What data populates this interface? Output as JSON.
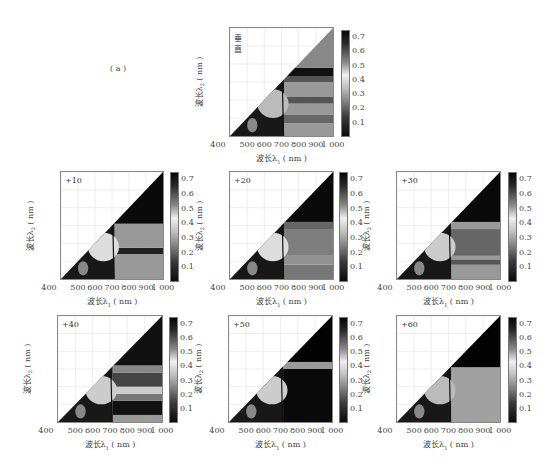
{
  "figure": {
    "label": "( a )",
    "background": "#ffffff"
  },
  "axes": {
    "xlabel": "波长λ1 ( nm )",
    "ylabel": "波长λ2 ( nm )",
    "xticks": [
      "400",
      "500",
      "600",
      "700",
      "800",
      "900",
      "1 000"
    ],
    "yticks": [
      "1 000",
      "900",
      "800",
      "700",
      "600",
      "500",
      "400"
    ],
    "colorbar_ticks": [
      "0.7",
      "0.6",
      "0.5",
      "0.4",
      "0.3",
      "0.2",
      "0.1"
    ]
  },
  "chart_data": [
    {
      "type": "heatmap",
      "title": "垂直",
      "xlabel": "波长λ1 ( nm )",
      "ylabel": "波长λ2 ( nm )",
      "xlim": [
        400,
        1000
      ],
      "ylim": [
        400,
        1000
      ],
      "xticks": [
        400,
        500,
        600,
        700,
        800,
        900,
        1000
      ],
      "yticks": [
        500,
        600,
        700,
        800,
        900,
        1000
      ],
      "colorbar": {
        "range": [
          0,
          0.75
        ],
        "ticks": [
          0.1,
          0.2,
          0.3,
          0.4,
          0.5,
          0.6,
          0.7
        ],
        "colormap": "gray_reversed"
      },
      "grid": true,
      "note": "lower-right triangle (λ1 > λ2) filled; upper-left blank",
      "bands": [
        {
          "y_from": 400,
          "y_to": 470,
          "value": 0.3
        },
        {
          "y_from": 470,
          "y_to": 520,
          "value": 0.45
        },
        {
          "y_from": 520,
          "y_to": 580,
          "value": 0.3
        },
        {
          "y_from": 580,
          "y_to": 620,
          "value": 0.5
        },
        {
          "y_from": 620,
          "y_to": 700,
          "value": 0.3
        },
        {
          "y_from": 700,
          "y_to": 730,
          "value": 0.5
        },
        {
          "y_from": 730,
          "y_to": 780,
          "value": 0.7
        },
        {
          "y_from": 780,
          "y_to": 1000,
          "value": 0.35
        }
      ],
      "left_region_value": 0.55
    },
    {
      "type": "heatmap",
      "title": "+10",
      "xlabel": "波长λ1 ( nm )",
      "ylabel": "波长λ2 ( nm )",
      "xlim": [
        400,
        1000
      ],
      "ylim": [
        400,
        1000
      ],
      "xticks": [
        400,
        500,
        600,
        700,
        800,
        900,
        1000
      ],
      "yticks": [
        500,
        600,
        700,
        800,
        900,
        1000
      ],
      "colorbar": {
        "range": [
          0,
          0.75
        ],
        "ticks": [
          0.1,
          0.2,
          0.3,
          0.4,
          0.5,
          0.6,
          0.7
        ],
        "colormap": "gray_reversed"
      },
      "grid": true,
      "bands": [
        {
          "y_from": 400,
          "y_to": 540,
          "value": 0.3
        },
        {
          "y_from": 540,
          "y_to": 575,
          "value": 0.65
        },
        {
          "y_from": 575,
          "y_to": 710,
          "value": 0.3
        },
        {
          "y_from": 710,
          "y_to": 1000,
          "value": 0.72
        }
      ],
      "left_region_value": 0.65
    },
    {
      "type": "heatmap",
      "title": "+20",
      "xlabel": "波长λ1 ( nm )",
      "ylabel": "波长λ2 ( nm )",
      "xlim": [
        400,
        1000
      ],
      "ylim": [
        400,
        1000
      ],
      "xticks": [
        400,
        500,
        600,
        700,
        800,
        900,
        1000
      ],
      "yticks": [
        500,
        600,
        700,
        800,
        900,
        1000
      ],
      "colorbar": {
        "range": [
          0,
          0.75
        ],
        "ticks": [
          0.1,
          0.2,
          0.3,
          0.4,
          0.5,
          0.6,
          0.7
        ],
        "colormap": "gray_reversed"
      },
      "grid": true,
      "bands": [
        {
          "y_from": 400,
          "y_to": 480,
          "value": 0.4
        },
        {
          "y_from": 480,
          "y_to": 530,
          "value": 0.32
        },
        {
          "y_from": 530,
          "y_to": 680,
          "value": 0.38
        },
        {
          "y_from": 680,
          "y_to": 720,
          "value": 0.45
        },
        {
          "y_from": 720,
          "y_to": 1000,
          "value": 0.72
        }
      ],
      "left_region_value": 0.65
    },
    {
      "type": "heatmap",
      "title": "+30",
      "xlabel": "波长λ1 ( nm )",
      "ylabel": "波长λ2 ( nm )",
      "xlim": [
        400,
        1000
      ],
      "ylim": [
        400,
        1000
      ],
      "xticks": [
        400,
        500,
        600,
        700,
        800,
        900,
        1000
      ],
      "yticks": [
        500,
        600,
        700,
        800,
        900,
        1000
      ],
      "colorbar": {
        "range": [
          0,
          0.75
        ],
        "ticks": [
          0.1,
          0.2,
          0.3,
          0.4,
          0.5,
          0.6,
          0.7
        ],
        "colormap": "gray_reversed"
      },
      "grid": true,
      "bands": [
        {
          "y_from": 400,
          "y_to": 480,
          "value": 0.3
        },
        {
          "y_from": 480,
          "y_to": 510,
          "value": 0.5
        },
        {
          "y_from": 510,
          "y_to": 530,
          "value": 0.3
        },
        {
          "y_from": 530,
          "y_to": 680,
          "value": 0.45
        },
        {
          "y_from": 680,
          "y_to": 720,
          "value": 0.3
        },
        {
          "y_from": 720,
          "y_to": 1000,
          "value": 0.72
        }
      ],
      "left_region_value": 0.6
    },
    {
      "type": "heatmap",
      "title": "+40",
      "xlabel": "波长λ1 ( nm )",
      "ylabel": "波长λ2 ( nm )",
      "xlim": [
        400,
        1000
      ],
      "ylim": [
        400,
        1000
      ],
      "xticks": [
        400,
        500,
        600,
        700,
        800,
        900,
        1000
      ],
      "yticks": [
        500,
        600,
        700,
        800,
        900,
        1000
      ],
      "colorbar": {
        "range": [
          0,
          0.75
        ],
        "ticks": [
          0.1,
          0.2,
          0.3,
          0.4,
          0.5,
          0.6,
          0.7
        ],
        "colormap": "gray_reversed"
      },
      "grid": true,
      "bands": [
        {
          "y_from": 400,
          "y_to": 440,
          "value": 0.3
        },
        {
          "y_from": 440,
          "y_to": 520,
          "value": 0.7
        },
        {
          "y_from": 520,
          "y_to": 560,
          "value": 0.4
        },
        {
          "y_from": 560,
          "y_to": 600,
          "value": 0.15
        },
        {
          "y_from": 600,
          "y_to": 680,
          "value": 0.55
        },
        {
          "y_from": 680,
          "y_to": 720,
          "value": 0.35
        },
        {
          "y_from": 720,
          "y_to": 1000,
          "value": 0.7
        }
      ],
      "left_region_value": 0.6
    },
    {
      "type": "heatmap",
      "title": "+50",
      "xlabel": "波长λ1 ( nm )",
      "ylabel": "波长λ2 ( nm )",
      "xlim": [
        400,
        1000
      ],
      "ylim": [
        400,
        1000
      ],
      "xticks": [
        400,
        500,
        600,
        700,
        800,
        900,
        1000
      ],
      "yticks": [
        500,
        600,
        700,
        800,
        900,
        1000
      ],
      "colorbar": {
        "range": [
          0,
          0.75
        ],
        "ticks": [
          0.1,
          0.2,
          0.3,
          0.4,
          0.5,
          0.6,
          0.7
        ],
        "colormap": "gray_reversed"
      },
      "grid": true,
      "bands": [
        {
          "y_from": 400,
          "y_to": 700,
          "value": 0.72
        },
        {
          "y_from": 700,
          "y_to": 740,
          "value": 0.3
        },
        {
          "y_from": 740,
          "y_to": 1000,
          "value": 0.74
        }
      ],
      "left_region_value": 0.6
    },
    {
      "type": "heatmap",
      "title": "+60",
      "xlabel": "波长λ1 ( nm )",
      "ylabel": "波长λ2 ( nm )",
      "xlim": [
        400,
        1000
      ],
      "ylim": [
        400,
        1000
      ],
      "xticks": [
        400,
        500,
        600,
        700,
        800,
        900,
        1000
      ],
      "yticks": [
        500,
        600,
        700,
        800,
        900,
        1000
      ],
      "colorbar": {
        "range": [
          0,
          0.75
        ],
        "ticks": [
          0.1,
          0.2,
          0.3,
          0.4,
          0.5,
          0.6,
          0.7
        ],
        "colormap": "gray_reversed"
      },
      "grid": true,
      "bands": [
        {
          "y_from": 400,
          "y_to": 710,
          "value": 0.28
        },
        {
          "y_from": 710,
          "y_to": 1000,
          "value": 0.74
        }
      ],
      "left_region_value": 0.55
    }
  ],
  "layout": {
    "panels": [
      {
        "plot": [
          229,
          27,
          105,
          110
        ],
        "cbar": [
          341,
          30,
          9,
          107
        ]
      },
      {
        "plot": [
          60,
          171,
          104,
          109
        ],
        "cbar": [
          170,
          172,
          9,
          110
        ]
      },
      {
        "plot": [
          229,
          171,
          105,
          109
        ],
        "cbar": [
          339,
          172,
          9,
          110
        ]
      },
      {
        "plot": [
          396,
          171,
          105,
          109
        ],
        "cbar": [
          508,
          172,
          9,
          110
        ]
      },
      {
        "plot": [
          57,
          315,
          106,
          108
        ],
        "cbar": [
          169,
          317,
          9,
          106
        ]
      },
      {
        "plot": [
          228,
          315,
          105,
          108
        ],
        "cbar": [
          339,
          317,
          9,
          106
        ]
      },
      {
        "plot": [
          396,
          315,
          105,
          108
        ],
        "cbar": [
          508,
          317,
          9,
          106
        ]
      }
    ],
    "figure_label_pos": [
      110,
      64
    ]
  }
}
